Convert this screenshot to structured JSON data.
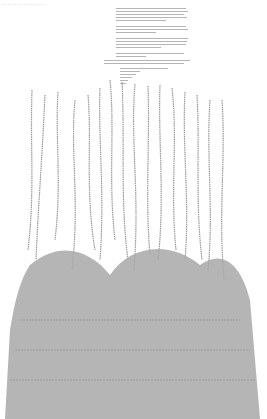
{
  "header": {
    "text": "— — — — — — — —"
  },
  "intro": {
    "paragraphs": [
      {
        "lines": 5
      },
      {
        "lines": 3
      },
      {
        "lines": 4
      },
      {
        "lines": 2
      }
    ],
    "note_lines": 2,
    "poem_lines": 6
  },
  "artwork": {
    "description": "Illustration composed of handwritten-style text strands forming tree-like/root shapes",
    "ink_color": "#8a8a8a"
  }
}
